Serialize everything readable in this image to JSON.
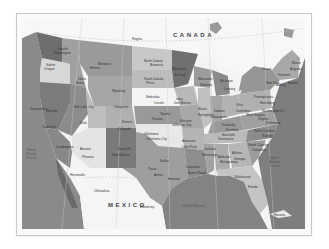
{
  "map": {
    "title": "United States political map",
    "countries": [
      {
        "name": "CANADA",
        "x": 151,
        "y": 14
      },
      {
        "name": "MEXICO",
        "x": 86,
        "y": 184
      }
    ],
    "oceans": [
      {
        "name": "North\nPacific\nOcean",
        "x": 4,
        "y": 130
      },
      {
        "name": "North\nAtlantic\nOcean",
        "x": 247,
        "y": 138
      },
      {
        "name": "Gulf of Mexico",
        "x": 160,
        "y": 186
      }
    ],
    "labels": [
      {
        "text": "Regina",
        "x": 110,
        "y": 20
      },
      {
        "text": "Ottawa",
        "x": 239,
        "y": 50
      },
      {
        "text": "Washington",
        "x": 32,
        "y": 34
      },
      {
        "text": "Seattle",
        "x": 36,
        "y": 30
      },
      {
        "text": "Oregon",
        "x": 22,
        "y": 50
      },
      {
        "text": "Salem",
        "x": 24,
        "y": 46
      },
      {
        "text": "Idaho",
        "x": 56,
        "y": 60
      },
      {
        "text": "Boise",
        "x": 54,
        "y": 64
      },
      {
        "text": "Montana",
        "x": 76,
        "y": 45
      },
      {
        "text": "Helena",
        "x": 68,
        "y": 49
      },
      {
        "text": "Wyoming",
        "x": 90,
        "y": 72
      },
      {
        "text": "Cheyenne",
        "x": 92,
        "y": 88
      },
      {
        "text": "Nevada",
        "x": 24,
        "y": 92
      },
      {
        "text": "Sacramento",
        "x": 8,
        "y": 90
      },
      {
        "text": "California",
        "x": 20,
        "y": 108
      },
      {
        "text": "Los Angeles",
        "x": 34,
        "y": 128
      },
      {
        "text": "Utah",
        "x": 58,
        "y": 104
      },
      {
        "text": "Salt Lake City",
        "x": 52,
        "y": 88
      },
      {
        "text": "Colorado",
        "x": 96,
        "y": 110
      },
      {
        "text": "Denver",
        "x": 100,
        "y": 103
      },
      {
        "text": "Arizona",
        "x": 58,
        "y": 130
      },
      {
        "text": "Phoenix",
        "x": 60,
        "y": 138
      },
      {
        "text": "New Mexico",
        "x": 90,
        "y": 136
      },
      {
        "text": "Santa Fe",
        "x": 96,
        "y": 130
      },
      {
        "text": "North Dakota",
        "x": 122,
        "y": 42
      },
      {
        "text": "Bismarck",
        "x": 128,
        "y": 46
      },
      {
        "text": "South Dakota",
        "x": 122,
        "y": 60
      },
      {
        "text": "Pierre",
        "x": 124,
        "y": 64
      },
      {
        "text": "Nebraska",
        "x": 124,
        "y": 78
      },
      {
        "text": "Lincoln",
        "x": 132,
        "y": 84
      },
      {
        "text": "Kansas",
        "x": 130,
        "y": 100
      },
      {
        "text": "Topeka",
        "x": 138,
        "y": 95
      },
      {
        "text": "Oklahoma",
        "x": 122,
        "y": 115
      },
      {
        "text": "Oklahoma City",
        "x": 124,
        "y": 120
      },
      {
        "text": "Texas",
        "x": 126,
        "y": 150
      },
      {
        "text": "Austin",
        "x": 132,
        "y": 156
      },
      {
        "text": "Dallas",
        "x": 138,
        "y": 142
      },
      {
        "text": "Houston",
        "x": 146,
        "y": 160
      },
      {
        "text": "Minnesota",
        "x": 150,
        "y": 50
      },
      {
        "text": "St. Paul",
        "x": 152,
        "y": 56
      },
      {
        "text": "Iowa",
        "x": 154,
        "y": 80
      },
      {
        "text": "Des Moines",
        "x": 152,
        "y": 84
      },
      {
        "text": "Missouri",
        "x": 158,
        "y": 102
      },
      {
        "text": "Jefferson City",
        "x": 150,
        "y": 106
      },
      {
        "text": "Arkansas",
        "x": 160,
        "y": 122
      },
      {
        "text": "Little Rock",
        "x": 160,
        "y": 128
      },
      {
        "text": "Louisiana",
        "x": 164,
        "y": 148
      },
      {
        "text": "Baton Rouge",
        "x": 166,
        "y": 154
      },
      {
        "text": "Wisconsin",
        "x": 176,
        "y": 60
      },
      {
        "text": "Madison",
        "x": 178,
        "y": 66
      },
      {
        "text": "Illinois",
        "x": 176,
        "y": 90
      },
      {
        "text": "Springfield",
        "x": 176,
        "y": 96
      },
      {
        "text": "Mississippi",
        "x": 180,
        "y": 136
      },
      {
        "text": "Jackson",
        "x": 182,
        "y": 130
      },
      {
        "text": "Michigan",
        "x": 198,
        "y": 62
      },
      {
        "text": "Lansing",
        "x": 202,
        "y": 70
      },
      {
        "text": "Indiana",
        "x": 192,
        "y": 92
      },
      {
        "text": "Indianapolis",
        "x": 188,
        "y": 98
      },
      {
        "text": "Kentucky",
        "x": 200,
        "y": 106
      },
      {
        "text": "Frankfort",
        "x": 204,
        "y": 111
      },
      {
        "text": "Tennessee",
        "x": 196,
        "y": 120
      },
      {
        "text": "Nashville",
        "x": 200,
        "y": 116
      },
      {
        "text": "Alabama",
        "x": 196,
        "y": 138
      },
      {
        "text": "Montgomery",
        "x": 198,
        "y": 143
      },
      {
        "text": "Ohio",
        "x": 214,
        "y": 86
      },
      {
        "text": "Columbus",
        "x": 214,
        "y": 92
      },
      {
        "text": "Georgia",
        "x": 212,
        "y": 140
      },
      {
        "text": "Atlanta",
        "x": 210,
        "y": 134
      },
      {
        "text": "Florida",
        "x": 226,
        "y": 168
      },
      {
        "text": "Tallahassee",
        "x": 212,
        "y": 158
      },
      {
        "text": "South Carolina",
        "x": 226,
        "y": 126
      },
      {
        "text": "Columbia",
        "x": 230,
        "y": 131
      },
      {
        "text": "North Carolina",
        "x": 232,
        "y": 112
      },
      {
        "text": "Raleigh",
        "x": 240,
        "y": 117
      },
      {
        "text": "Virginia",
        "x": 236,
        "y": 100
      },
      {
        "text": "Richmond",
        "x": 244,
        "y": 104
      },
      {
        "text": "West Virginia",
        "x": 224,
        "y": 96
      },
      {
        "text": "Pennsylvania",
        "x": 232,
        "y": 78
      },
      {
        "text": "Harrisburg",
        "x": 238,
        "y": 84
      },
      {
        "text": "New York",
        "x": 244,
        "y": 64
      },
      {
        "text": "Albany",
        "x": 254,
        "y": 66
      },
      {
        "text": "Maine",
        "x": 270,
        "y": 44
      },
      {
        "text": "Augusta",
        "x": 268,
        "y": 50
      },
      {
        "text": "Vermont",
        "x": 256,
        "y": 56
      },
      {
        "text": "Boston",
        "x": 266,
        "y": 64
      },
      {
        "text": "Washington D.C.",
        "x": 240,
        "y": 92
      },
      {
        "text": "Chihuahua",
        "x": 72,
        "y": 172
      },
      {
        "text": "Hermosillo",
        "x": 48,
        "y": 156
      },
      {
        "text": "Monterrey",
        "x": 118,
        "y": 188
      },
      {
        "text": "Havana",
        "x": 252,
        "y": 196
      }
    ]
  }
}
